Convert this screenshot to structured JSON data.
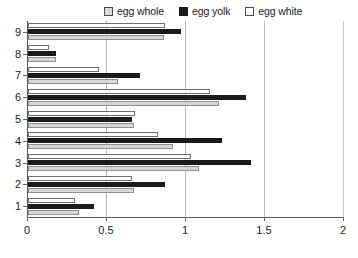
{
  "chart_data": {
    "type": "bar",
    "orientation": "horizontal",
    "title": "",
    "xlabel": "",
    "ylabel": "",
    "xlim": [
      0,
      2
    ],
    "ylim": [
      0,
      9
    ],
    "grid": true,
    "legend_position": "top",
    "xticks": [
      "0",
      "0.5",
      "1",
      "1.5",
      "2"
    ],
    "xtick_values": [
      0,
      0.5,
      1,
      1.5,
      2
    ],
    "categories": [
      "1",
      "2",
      "3",
      "4",
      "5",
      "6",
      "7",
      "8",
      "9"
    ],
    "series": [
      {
        "name": "egg whole",
        "color": "#d6d6d6",
        "values": [
          0.32,
          0.67,
          1.08,
          0.92,
          0.67,
          1.21,
          0.57,
          0.18,
          0.86
        ]
      },
      {
        "name": "egg yolk",
        "color": "#1b1b1b",
        "values": [
          0.42,
          0.87,
          1.41,
          1.23,
          0.66,
          1.38,
          0.71,
          0.18,
          0.97
        ]
      },
      {
        "name": "egg white",
        "color": "#ffffff",
        "values": [
          0.3,
          0.66,
          1.03,
          0.82,
          0.68,
          1.15,
          0.45,
          0.13,
          0.87
        ]
      }
    ]
  },
  "legend": {
    "items": [
      {
        "label": "egg whole",
        "swatch": "whole-swatch-icon"
      },
      {
        "label": "egg yolk",
        "swatch": "yolk-swatch-icon"
      },
      {
        "label": "egg white",
        "swatch": "white-swatch-icon"
      }
    ]
  }
}
